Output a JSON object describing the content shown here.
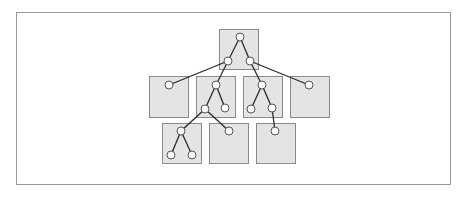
{
  "diagram": {
    "title": "",
    "colors": {
      "box_fill": "#e4e4e4",
      "box_stroke": "#8a8a8a",
      "node_fill": "#ffffff",
      "node_stroke": "#555555",
      "edge": "#2a2a2a",
      "frame": "#9a9a9a"
    },
    "boxes": [
      {
        "id": "top",
        "x": 219,
        "y": 29,
        "w": 39,
        "h": 40
      },
      {
        "id": "mid-1",
        "x": 149,
        "y": 76,
        "w": 39,
        "h": 41
      },
      {
        "id": "mid-2",
        "x": 196,
        "y": 76,
        "w": 39,
        "h": 41
      },
      {
        "id": "mid-3",
        "x": 243,
        "y": 76,
        "w": 39,
        "h": 41
      },
      {
        "id": "mid-4",
        "x": 290,
        "y": 76,
        "w": 39,
        "h": 41
      },
      {
        "id": "bottom-1",
        "x": 162,
        "y": 123,
        "w": 39,
        "h": 40
      },
      {
        "id": "bottom-2",
        "x": 209,
        "y": 123,
        "w": 39,
        "h": 40
      },
      {
        "id": "bottom-3",
        "x": 256,
        "y": 123,
        "w": 39,
        "h": 40
      }
    ],
    "nodes": [
      {
        "id": "n0",
        "x": 240,
        "y": 37
      },
      {
        "id": "n1",
        "x": 228,
        "y": 61
      },
      {
        "id": "n2",
        "x": 250,
        "y": 61
      },
      {
        "id": "n3",
        "x": 169,
        "y": 85
      },
      {
        "id": "n4",
        "x": 216,
        "y": 85
      },
      {
        "id": "n5",
        "x": 262,
        "y": 85
      },
      {
        "id": "n6",
        "x": 309,
        "y": 85
      },
      {
        "id": "n7",
        "x": 205,
        "y": 109
      },
      {
        "id": "n8",
        "x": 225,
        "y": 108
      },
      {
        "id": "n9",
        "x": 251,
        "y": 109
      },
      {
        "id": "n10",
        "x": 272,
        "y": 108
      },
      {
        "id": "n11",
        "x": 181,
        "y": 131
      },
      {
        "id": "n12",
        "x": 229,
        "y": 131
      },
      {
        "id": "n13",
        "x": 275,
        "y": 131
      },
      {
        "id": "n14",
        "x": 171,
        "y": 155
      },
      {
        "id": "n15",
        "x": 192,
        "y": 155
      }
    ],
    "edges": [
      [
        "n0",
        "n1"
      ],
      [
        "n0",
        "n2"
      ],
      [
        "n1",
        "n3"
      ],
      [
        "n1",
        "n4"
      ],
      [
        "n2",
        "n5"
      ],
      [
        "n2",
        "n6"
      ],
      [
        "n4",
        "n7"
      ],
      [
        "n4",
        "n8"
      ],
      [
        "n5",
        "n9"
      ],
      [
        "n5",
        "n10"
      ],
      [
        "n7",
        "n11"
      ],
      [
        "n7",
        "n12"
      ],
      [
        "n10",
        "n13"
      ],
      [
        "n11",
        "n14"
      ],
      [
        "n11",
        "n15"
      ]
    ],
    "node_radius": 4
  }
}
